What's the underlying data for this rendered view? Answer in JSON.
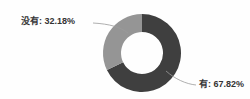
{
  "chart_data": {
    "type": "pie",
    "variant": "donut",
    "title": "",
    "subtitle": "",
    "xlabel": "",
    "ylabel": "",
    "grid": false,
    "legend_position": "none",
    "label_format": "{name}: {percent}%",
    "total_percent": 100,
    "start_angle_deg": 0,
    "direction": "clockwise",
    "categories": [
      "有",
      "没有"
    ],
    "values": [
      67.82,
      32.18
    ],
    "colors": [
      "#3f3f3f",
      "#959595"
    ],
    "slices": [
      {
        "name": "有",
        "percent": 67.82,
        "value_text": "67.82%",
        "label": "有: 67.82%",
        "color": "#3f3f3f",
        "leader_side": "right"
      },
      {
        "name": "没有",
        "percent": 32.18,
        "value_text": "32.18%",
        "label": "没有: 32.18%",
        "color": "#959595",
        "leader_side": "left"
      }
    ]
  },
  "geometry": {
    "center_x": 142,
    "center_y": 53,
    "outer_radius": 39,
    "inner_radius": 21
  },
  "style": {
    "background": "#fefefe",
    "text_color": "#343434",
    "leader_color": "#9a9a9a"
  }
}
